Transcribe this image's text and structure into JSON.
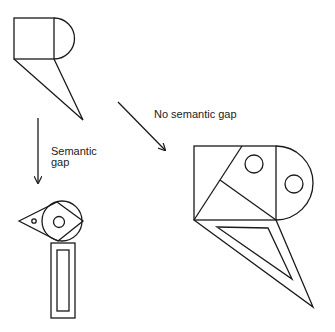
{
  "diagram": {
    "labels": {
      "semantic_gap_line1": "Semantic",
      "semantic_gap_line2": "gap",
      "no_semantic_gap": "No semantic gap"
    },
    "figures": [
      {
        "id": "source-figure",
        "description": "Square with semicircle on the right and triangle pointing down-right"
      },
      {
        "id": "semantic-gap-result",
        "description": "Bird-like figure: triangle beak with dot, circle with diamond and inner circle, rectangular body"
      },
      {
        "id": "no-semantic-gap-result",
        "description": "Enlarged source figure decorated with diagonals, two circles and inset triangle"
      }
    ],
    "colors": {
      "stroke": "#1a1a1a",
      "background": "#ffffff"
    }
  }
}
